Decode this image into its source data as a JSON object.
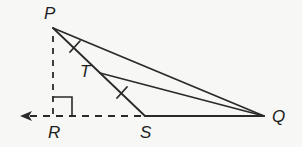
{
  "diagram": {
    "type": "geometry-figure",
    "colors": {
      "stroke": "#2a2a2a",
      "background": "#f7f7f5",
      "label": "#1e1e1e"
    },
    "points": {
      "P": {
        "label": "P",
        "x": 53,
        "y": 28,
        "label_x": 44,
        "label_y": 19
      },
      "R": {
        "label": "R",
        "x": 53,
        "y": 116,
        "label_x": 48,
        "label_y": 138
      },
      "S": {
        "label": "S",
        "x": 145,
        "y": 116,
        "label_x": 140,
        "label_y": 138
      },
      "Q": {
        "label": "Q",
        "x": 264,
        "y": 116,
        "label_x": 272,
        "label_y": 122
      },
      "T": {
        "label": "T",
        "x": 100,
        "y": 73,
        "label_x": 80,
        "label_y": 77
      }
    },
    "segments": [
      {
        "from": "P",
        "to": "Q",
        "style": "solid"
      },
      {
        "from": "P",
        "to": "S",
        "style": "solid"
      },
      {
        "from": "T",
        "to": "Q",
        "style": "solid"
      },
      {
        "from": "S",
        "to": "Q",
        "style": "solid"
      },
      {
        "from": "P",
        "to": "R",
        "style": "dashed"
      },
      {
        "from": "R",
        "to": "S",
        "style": "dashed"
      }
    ],
    "ray": {
      "from": "R",
      "direction": "left",
      "style": "dashed",
      "arrow": true
    },
    "right_angle_marker": {
      "at": "R"
    },
    "congruence_ticks": [
      {
        "segment": "PT",
        "count": 1
      },
      {
        "segment": "TS",
        "count": 1
      }
    ]
  }
}
